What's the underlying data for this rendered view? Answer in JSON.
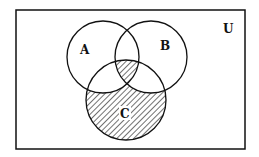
{
  "diagram": {
    "type": "venn",
    "universe_label": "U",
    "sets": [
      {
        "label": "A",
        "cx": 103,
        "cy": 57,
        "r": 36
      },
      {
        "label": "B",
        "cx": 151,
        "cy": 57,
        "r": 36
      },
      {
        "label": "C",
        "cx": 126,
        "cy": 100,
        "r": 40
      }
    ],
    "shaded_regions": [
      "C only (C − (A ∪ B))",
      "A ∩ B ∩ C"
    ],
    "colors": {
      "line": "#111111",
      "background": "#ffffff"
    }
  }
}
